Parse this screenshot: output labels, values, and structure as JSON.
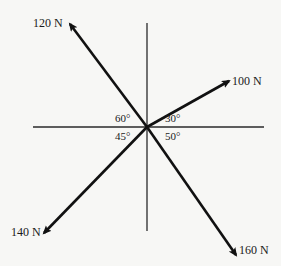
{
  "diagram": {
    "type": "force-vector-diagram",
    "origin": {
      "x": 147,
      "y": 127
    },
    "axes": {
      "horizontal": {
        "x1": 33,
        "x2": 264,
        "y": 127
      },
      "vertical": {
        "x": 147,
        "y1": 23,
        "y2": 231
      }
    },
    "forces": [
      {
        "label": "120 N",
        "magnitude": 120,
        "angle_from_axis": "60°",
        "quadrant": "upper-left",
        "tip": {
          "x": 70,
          "y": 24
        },
        "label_pos": {
          "x": 33,
          "y": 27
        }
      },
      {
        "label": "100 N",
        "magnitude": 100,
        "angle_from_axis": "30°",
        "quadrant": "upper-right",
        "tip": {
          "x": 229,
          "y": 81
        },
        "label_pos": {
          "x": 232,
          "y": 85
        }
      },
      {
        "label": "140 N",
        "magnitude": 140,
        "angle_from_axis": "45°",
        "quadrant": "lower-left",
        "tip": {
          "x": 44,
          "y": 233
        },
        "label_pos": {
          "x": 11,
          "y": 236
        }
      },
      {
        "label": "160 N",
        "magnitude": 160,
        "angle_from_axis": "50°",
        "quadrant": "lower-right",
        "tip": {
          "x": 236,
          "y": 255
        },
        "label_pos": {
          "x": 239,
          "y": 254
        }
      }
    ],
    "angles": [
      {
        "label": "60°",
        "pos": {
          "x": 115,
          "y": 122
        }
      },
      {
        "label": "30°",
        "pos": {
          "x": 165,
          "y": 122
        }
      },
      {
        "label": "45°",
        "pos": {
          "x": 115,
          "y": 140
        }
      },
      {
        "label": "50°",
        "pos": {
          "x": 165,
          "y": 140
        }
      }
    ],
    "colors": {
      "line": "#111111",
      "axis": "#2a2a2a",
      "background": "#f7f7f5"
    }
  }
}
